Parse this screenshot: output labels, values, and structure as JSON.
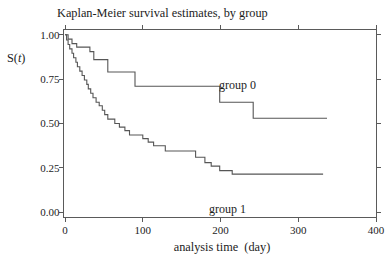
{
  "chart_data": {
    "type": "line",
    "subtype": "step-survival",
    "title": "Kaplan-Meier survival estimates, by group",
    "xlabel": "analysis time  (day)",
    "ylabel": "S(t)",
    "ylabel_parts": [
      "S(",
      "t",
      ")"
    ],
    "xlim": [
      0,
      400
    ],
    "ylim": [
      0.0,
      1.0
    ],
    "xticks": [
      0,
      100,
      200,
      300,
      400
    ],
    "ytick_labels": [
      "0.00",
      "0.25",
      "0.50",
      "0.75",
      "1.00"
    ],
    "ytick_values": [
      0.0,
      0.25,
      0.5,
      0.75,
      1.0
    ],
    "grid": false,
    "legend_position": "inline-labels",
    "frame": "all-four-sides-outward-ticks",
    "colors": {
      "line": "#565656",
      "axis": "#5a5a5a",
      "text": "#1c1c1c",
      "background": "#ffffff"
    },
    "series": [
      {
        "name": "group 0",
        "end_t": 337,
        "steps": [
          [
            0,
            1.0
          ],
          [
            4,
            0.975
          ],
          [
            9,
            0.95
          ],
          [
            15,
            0.93
          ],
          [
            32,
            0.905
          ],
          [
            37,
            0.86
          ],
          [
            55,
            0.79
          ],
          [
            90,
            0.71
          ],
          [
            199,
            0.62
          ],
          [
            242,
            0.53
          ]
        ],
        "label_px": {
          "x": 219,
          "y": 89
        }
      },
      {
        "name": "group 1",
        "end_t": 332,
        "steps": [
          [
            0,
            1.0
          ],
          [
            2,
            0.97
          ],
          [
            4,
            0.945
          ],
          [
            6,
            0.92
          ],
          [
            9,
            0.895
          ],
          [
            11,
            0.87
          ],
          [
            14,
            0.845
          ],
          [
            16,
            0.82
          ],
          [
            19,
            0.795
          ],
          [
            22,
            0.77
          ],
          [
            25,
            0.745
          ],
          [
            28,
            0.72
          ],
          [
            30,
            0.695
          ],
          [
            33,
            0.67
          ],
          [
            36,
            0.645
          ],
          [
            40,
            0.62
          ],
          [
            44,
            0.6
          ],
          [
            48,
            0.575
          ],
          [
            51,
            0.55
          ],
          [
            55,
            0.525
          ],
          [
            64,
            0.5
          ],
          [
            70,
            0.48
          ],
          [
            77,
            0.46
          ],
          [
            83,
            0.435
          ],
          [
            100,
            0.415
          ],
          [
            107,
            0.395
          ],
          [
            114,
            0.375
          ],
          [
            129,
            0.345
          ],
          [
            168,
            0.31
          ],
          [
            180,
            0.28
          ],
          [
            188,
            0.26
          ],
          [
            199,
            0.235
          ],
          [
            215,
            0.215
          ]
        ],
        "label_px": {
          "x": 209,
          "y": 212.5
        }
      }
    ]
  }
}
